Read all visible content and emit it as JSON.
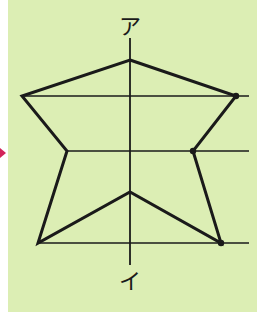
{
  "diagram": {
    "labels": {
      "top": "ア",
      "bottom": "イ"
    },
    "colors": {
      "background": "#dceeb4",
      "line": "#1a1a1a",
      "arrow": "#d2245a"
    },
    "axis": {
      "x": 130,
      "y_start": 38,
      "y_end": 265
    },
    "guide_lines": [
      {
        "y": 96,
        "x_start": 22,
        "x_end": 249
      },
      {
        "y": 151,
        "x_start": 67,
        "x_end": 249
      },
      {
        "y": 243,
        "x_start": 38,
        "x_end": 249
      }
    ],
    "polygon_vertices": [
      [
        130,
        60
      ],
      [
        236,
        96
      ],
      [
        193,
        151
      ],
      [
        221,
        243
      ],
      [
        130,
        192
      ],
      [
        38,
        243
      ],
      [
        67,
        151
      ],
      [
        22,
        96
      ]
    ],
    "marked_points": [
      [
        236,
        96
      ],
      [
        193,
        151
      ],
      [
        221,
        243
      ]
    ]
  }
}
